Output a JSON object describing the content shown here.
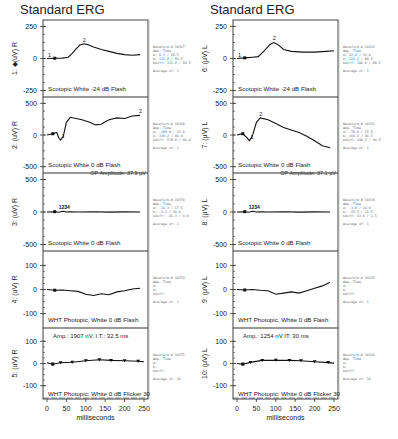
{
  "chart_data": [
    {
      "type": "line",
      "title": "Standard ERG",
      "eye": "R",
      "xlabel": "milliseconds",
      "x_ticks": [
        0,
        50,
        100,
        150,
        200,
        250
      ],
      "panels": [
        {
          "id": 1,
          "ylabel": "1: ◆(uV) R",
          "y_ticks": [
            250,
            0,
            -250
          ],
          "ylim": [
            -300,
            300
          ],
          "label": "Scotopic White -24 dB Flash",
          "markers": [
            "1",
            "2"
          ],
          "series": [
            [
              0,
              0
            ],
            [
              20,
              2
            ],
            [
              40,
              3
            ],
            [
              55,
              10
            ],
            [
              65,
              40
            ],
            [
              75,
              75
            ],
            [
              85,
              105
            ],
            [
              95,
              115
            ],
            [
              105,
              108
            ],
            [
              120,
              90
            ],
            [
              140,
              70
            ],
            [
              160,
              55
            ],
            [
              180,
              40
            ],
            [
              200,
              30
            ],
            [
              220,
              25
            ],
            [
              240,
              30
            ]
          ],
          "info": {
            "waveform": "Waveform # 10367",
            "a": "0.3 / 28.5",
            "b": "111.8 / 93.5",
            "bdiff": "111.4 / 93.5",
            "average": "Average of: 1"
          }
        },
        {
          "id": 2,
          "ylabel": "2: (uV) R",
          "y_ticks": [
            500,
            0,
            -500
          ],
          "ylim": [
            -600,
            600
          ],
          "label": "Scotopic White 0 dB Flash",
          "markers": [
            "1",
            "2"
          ],
          "series": [
            [
              0,
              0
            ],
            [
              15,
              20
            ],
            [
              25,
              40
            ],
            [
              30,
              -40
            ],
            [
              35,
              -80
            ],
            [
              42,
              -20
            ],
            [
              50,
              200
            ],
            [
              60,
              280
            ],
            [
              75,
              260
            ],
            [
              90,
              240
            ],
            [
              110,
              200
            ],
            [
              125,
              160
            ],
            [
              140,
              170
            ],
            [
              150,
              210
            ],
            [
              160,
              240
            ],
            [
              180,
              270
            ],
            [
              200,
              260
            ],
            [
              220,
              300
            ],
            [
              240,
              310
            ]
          ],
          "info": {
            "waveform": "Waveform # 10369",
            "a": "-189.9 / 15.0",
            "b": "330.2 / 46.0",
            "bdiff": "519.9 / 46.0",
            "average": "Average of: 1"
          },
          "op_amplitude": "OP Amplitude: 37.9 µV"
        },
        {
          "id": 3,
          "ylabel": "3: (uV) R",
          "y_ticks": [
            500,
            0,
            -500
          ],
          "ylim": [
            -600,
            600
          ],
          "label": "Scotopic White 0 dB Flash",
          "markers": [
            "1",
            "2",
            "3",
            "4"
          ],
          "series": [
            [
              0,
              0
            ],
            [
              20,
              5
            ],
            [
              30,
              -5
            ],
            [
              40,
              10
            ],
            [
              50,
              0
            ],
            [
              60,
              5
            ],
            [
              80,
              0
            ],
            [
              120,
              3
            ],
            [
              160,
              -2
            ],
            [
              200,
              2
            ],
            [
              240,
              0
            ]
          ],
          "info": {
            "waveform": "Waveform # 10370",
            "a": "-16.3 / 17.5",
            "b": "-3.3 / 30.0",
            "bdiff": "-16.3 / 0.0",
            "average": "Average of: 1"
          }
        },
        {
          "id": 4,
          "ylabel": "4: (uV) R",
          "y_ticks": [
            100,
            0,
            -100
          ],
          "ylim": [
            -160,
            160
          ],
          "label": "WHT Photopic,  White 0 dB Flash",
          "markers": [],
          "series": [
            [
              0,
              0
            ],
            [
              20,
              -3
            ],
            [
              40,
              -2
            ],
            [
              60,
              -5
            ],
            [
              80,
              -8
            ],
            [
              100,
              -20
            ],
            [
              120,
              -25
            ],
            [
              140,
              -18
            ],
            [
              160,
              -22
            ],
            [
              180,
              -10
            ],
            [
              200,
              -5
            ],
            [
              220,
              2
            ],
            [
              240,
              5
            ]
          ],
          "info": {
            "waveform": "Waveform # 10374",
            "average": "Average of: 1"
          }
        },
        {
          "id": 5,
          "ylabel": "5: (uV) R",
          "y_ticks": [
            100,
            0,
            -100
          ],
          "ylim": [
            -160,
            160
          ],
          "label": "WHT Photopic: White 0 dB Flicker 30",
          "annotation": "Amp.: 1907 nV, I.T.: 32.5 ms",
          "markers": [],
          "series": [
            [
              0,
              3
            ],
            [
              15,
              -3
            ],
            [
              35,
              3
            ],
            [
              65,
              6
            ],
            [
              100,
              12
            ],
            [
              135,
              17
            ],
            [
              165,
              14
            ],
            [
              200,
              12
            ],
            [
              235,
              10
            ],
            [
              250,
              8
            ]
          ],
          "info": {
            "waveform": "Waveform # 10375",
            "average": "Average of: 10"
          }
        }
      ]
    },
    {
      "type": "line",
      "title": "Standard ERG",
      "eye": "L",
      "xlabel": "milliseconds",
      "x_ticks": [
        0,
        50,
        100,
        150,
        200,
        250
      ],
      "panels": [
        {
          "id": 6,
          "ylabel": "6: (µV) L",
          "y_ticks": [
            250,
            0,
            -250
          ],
          "ylim": [
            -300,
            300
          ],
          "label": "Scotopic White -24 dB Flash",
          "markers": [
            "1",
            "2"
          ],
          "series": [
            [
              0,
              0
            ],
            [
              20,
              5
            ],
            [
              40,
              10
            ],
            [
              55,
              15
            ],
            [
              70,
              60
            ],
            [
              85,
              110
            ],
            [
              95,
              125
            ],
            [
              105,
              110
            ],
            [
              120,
              70
            ],
            [
              140,
              55
            ],
            [
              170,
              50
            ],
            [
              200,
              50
            ],
            [
              230,
              55
            ],
            [
              250,
              60
            ]
          ],
          "info": {
            "waveform": "Waveform # 10332",
            "a": "22.0 / 33.0",
            "b": "122.1 / 88.5",
            "bdiff": "100.0 / 88.5",
            "average": "Average of: 1"
          }
        },
        {
          "id": 7,
          "ylabel": "7: (µV) L",
          "y_ticks": [
            500,
            0,
            -500
          ],
          "ylim": [
            -600,
            600
          ],
          "label": "Scotopic White 0 dB Flash",
          "markers": [
            "1",
            "2"
          ],
          "series": [
            [
              0,
              0
            ],
            [
              15,
              20
            ],
            [
              25,
              -40
            ],
            [
              32,
              -90
            ],
            [
              40,
              -10
            ],
            [
              50,
              200
            ],
            [
              60,
              270
            ],
            [
              80,
              240
            ],
            [
              100,
              180
            ],
            [
              120,
              120
            ],
            [
              140,
              80
            ],
            [
              160,
              40
            ],
            [
              180,
              -20
            ],
            [
              200,
              -90
            ],
            [
              220,
              -170
            ],
            [
              240,
              -200
            ]
          ],
          "info": {
            "waveform": "Waveform # 10331",
            "a": "-78.0 / 15.5",
            "b": "166.2 / 46.5",
            "bdiff": "244.2 / 46.5",
            "average": "Average of: 1"
          },
          "op_amplitude": "OP Amplitude: 37.1 µV"
        },
        {
          "id": 8,
          "ylabel": "8: (µV) L",
          "y_ticks": [
            500,
            0,
            -500
          ],
          "ylim": [
            -600,
            600
          ],
          "label": "Scotopic White 0 dB Flash",
          "markers": [
            "1",
            "2",
            "3",
            "4"
          ],
          "series": [
            [
              0,
              0
            ],
            [
              20,
              5
            ],
            [
              30,
              -5
            ],
            [
              40,
              10
            ],
            [
              50,
              0
            ],
            [
              60,
              5
            ],
            [
              80,
              0
            ],
            [
              120,
              3
            ],
            [
              160,
              -2
            ],
            [
              200,
              2
            ],
            [
              240,
              0
            ]
          ],
          "info": {
            "waveform": "Waveform # 10334",
            "a": "-3.8 / 16.0",
            "b": "-15.5 / 11.5",
            "bdiff": "13.0 / 1.5",
            "average": "Average of: 1"
          }
        },
        {
          "id": 9,
          "ylabel": "9: (µV) L",
          "y_ticks": [
            100,
            0,
            -100
          ],
          "ylim": [
            -160,
            160
          ],
          "label": "WHT Photopic,  White 0 dB Flash",
          "markers": [],
          "series": [
            [
              0,
              0
            ],
            [
              20,
              -2
            ],
            [
              40,
              0
            ],
            [
              60,
              -3
            ],
            [
              80,
              -5
            ],
            [
              100,
              -20
            ],
            [
              120,
              -15
            ],
            [
              140,
              -10
            ],
            [
              160,
              -15
            ],
            [
              180,
              -5
            ],
            [
              200,
              5
            ],
            [
              220,
              15
            ],
            [
              240,
              30
            ]
          ],
          "info": {
            "waveform": "Waveform # 10335",
            "average": "Average of: 1"
          }
        },
        {
          "id": 10,
          "ylabel": "10: (µV) L",
          "y_ticks": [
            100,
            0,
            -100
          ],
          "ylim": [
            -160,
            160
          ],
          "label": "WHT Photopic: White 0 dB Flicker 30",
          "annotation": "Amp.: 1254 nV  IT:  30 ms",
          "markers": [],
          "series": [
            [
              0,
              0
            ],
            [
              15,
              -3
            ],
            [
              35,
              5
            ],
            [
              65,
              14
            ],
            [
              100,
              15
            ],
            [
              135,
              14
            ],
            [
              165,
              12
            ],
            [
              200,
              8
            ],
            [
              235,
              4
            ],
            [
              250,
              2
            ]
          ],
          "info": {
            "waveform": "Waveform # 10336",
            "average": "Average of: 10"
          }
        }
      ]
    }
  ],
  "columns": [
    {
      "title": "Standard ERG",
      "xlabel": "milliseconds"
    },
    {
      "title": "Standard ERG",
      "xlabel": "milliseconds"
    }
  ]
}
